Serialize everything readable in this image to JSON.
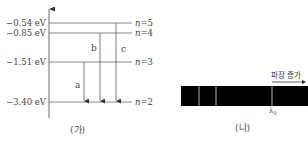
{
  "panel_a": {
    "caption": "(가)",
    "levels": [
      {
        "n_label": "n",
        "n_value": "=5",
        "energy": "−0.54 eV",
        "y": 23
      },
      {
        "n_label": "n",
        "n_value": "=4",
        "energy": "−0.85 eV",
        "y": 33
      },
      {
        "n_label": "n",
        "n_value": "=3",
        "energy": "−1.51 eV",
        "y": 62
      },
      {
        "n_label": "n",
        "n_value": "=2",
        "energy": "−3.40 eV",
        "y": 102
      }
    ],
    "transitions": [
      {
        "label": "a",
        "from": "n=3",
        "to": "n=2"
      },
      {
        "label": "b",
        "from": "n=4",
        "to": "n=2"
      },
      {
        "label": "c",
        "from": "n=5",
        "to": "n=2"
      }
    ]
  },
  "panel_b": {
    "caption": "(나)",
    "direction_label": "파장 증가",
    "marker_label": "λ",
    "marker_sub": "0",
    "colors": {
      "spectrum_bg": "#000000",
      "line": "#ffffff"
    }
  }
}
